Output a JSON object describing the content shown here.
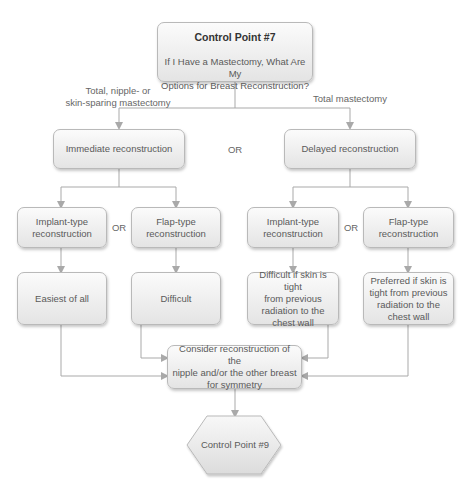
{
  "top": {
    "title": "Control Point #7",
    "question_line1": "If I Have a Mastectomy, What Are My",
    "question_line2": "Options for Breast Reconstruction?"
  },
  "branch_labels": {
    "left_line1": "Total, nipple- or",
    "left_line2": "skin-sparing mastectomy",
    "right": "Total mastectomy"
  },
  "level2": {
    "left": "Immediate reconstruction",
    "or": "OR",
    "right": "Delayed reconstruction"
  },
  "level3": {
    "left_implant_line1": "Implant-type",
    "left_implant_line2": "reconstruction",
    "left_or": "OR",
    "left_flap_line1": "Flap-type",
    "left_flap_line2": "reconstruction",
    "right_implant_line1": "Implant-type",
    "right_implant_line2": "reconstruction",
    "right_or": "OR",
    "right_flap_line1": "Flap-type",
    "right_flap_line2": "reconstruction"
  },
  "level4": {
    "left_implant": "Easiest of all",
    "left_flap": "Difficult",
    "right_implant": [
      "Difficult if skin is tight",
      "from previous",
      "radiation to the",
      "chest wall"
    ],
    "right_flap": [
      "Preferred if skin is",
      "tight from previous",
      "radiation to the",
      "chest wall"
    ]
  },
  "merge": {
    "line1": "Consider reconstruction of the",
    "line2": "nipple and/or the other breast",
    "line3": "for symmetry"
  },
  "end": {
    "label": "Control Point #9"
  },
  "colors": {
    "line": "#a9a9a9",
    "box_border": "#b9b9b9",
    "box_top": "#fbfbfb",
    "box_bottom": "#e4e4e4"
  }
}
